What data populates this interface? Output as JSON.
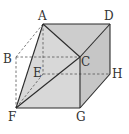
{
  "figure": {
    "type": "cube-cross-section",
    "colors": {
      "fill_top": "#cfcfcf",
      "fill_front": "#d6d6d6",
      "fill_right": "#c4c4c4",
      "fill_left": "#dcdcdc",
      "edge": "#2b2b2b",
      "hidden_edge": "#555555"
    },
    "vertices": {
      "A": {
        "label": "A",
        "x": 43,
        "y": 24
      },
      "B": {
        "label": "B",
        "x": 16,
        "y": 57
      },
      "C": {
        "label": "C",
        "x": 80,
        "y": 57
      },
      "D": {
        "label": "D",
        "x": 110,
        "y": 24
      },
      "E": {
        "label": "E",
        "x": 43,
        "y": 74
      },
      "F": {
        "label": "F",
        "x": 16,
        "y": 108
      },
      "G": {
        "label": "G",
        "x": 80,
        "y": 108
      },
      "H": {
        "label": "H",
        "x": 110,
        "y": 74
      }
    },
    "labels": {
      "A": "A",
      "B": "B",
      "C": "C",
      "D": "D",
      "E": "E",
      "F": "F",
      "G": "G",
      "H": "H"
    }
  }
}
